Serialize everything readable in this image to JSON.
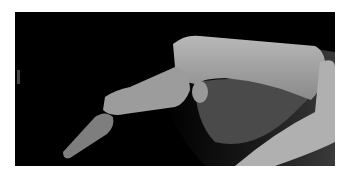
{
  "image": {
    "subject": "lateral radiograph of finger",
    "background_color": "#ffffff",
    "film_color": "#000000"
  }
}
